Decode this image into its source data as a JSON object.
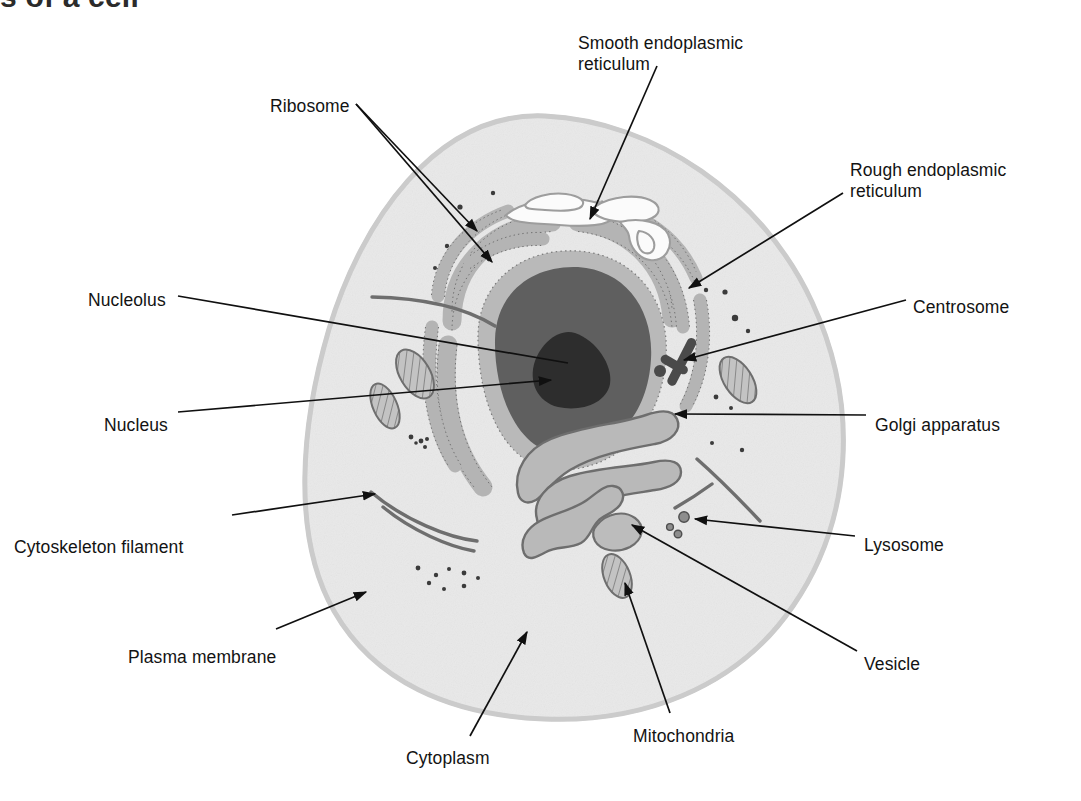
{
  "page": {
    "title_partial": "s of a cell",
    "background_color": "#ffffff",
    "width": 1081,
    "height": 801
  },
  "diagram": {
    "kind": "animal-cell-cross-section",
    "colors": {
      "cytoplasm": "#e8e8e8",
      "cytoplasm_edge": "#d6d6d6",
      "organelle_gray": "#b8b8b8",
      "organelle_outline": "#6e6e6e",
      "nucleoplasm": "#5e5e5e",
      "nucleolus": "#2e2e2e",
      "centrosome": "#4a4a4a",
      "filament": "#6d6d6d",
      "leader_line": "#101010",
      "smooth_er_fill": "#fbfbfb",
      "text": "#131313"
    }
  },
  "labels": [
    {
      "id": "ribosome",
      "text": "Ribosome",
      "x": 270,
      "y": 96,
      "align": "left"
    },
    {
      "id": "smooth-er",
      "text": "Smooth endoplasmic",
      "x": 578,
      "y": 33,
      "align": "left"
    },
    {
      "id": "smooth-er-2",
      "text": "reticulum",
      "x": 578,
      "y": 54,
      "align": "left"
    },
    {
      "id": "rough-er",
      "text": "Rough endoplasmic",
      "x": 850,
      "y": 160,
      "align": "left"
    },
    {
      "id": "rough-er-2",
      "text": "reticulum",
      "x": 850,
      "y": 181,
      "align": "left"
    },
    {
      "id": "nucleolus",
      "text": "Nucleolus",
      "x": 88,
      "y": 290,
      "align": "left"
    },
    {
      "id": "centrosome",
      "text": "Centrosome",
      "x": 913,
      "y": 297,
      "align": "left"
    },
    {
      "id": "nucleus",
      "text": "Nucleus",
      "x": 104,
      "y": 415,
      "align": "left"
    },
    {
      "id": "golgi",
      "text": "Golgi apparatus",
      "x": 875,
      "y": 415,
      "align": "left"
    },
    {
      "id": "cytoskeleton-filament",
      "text": "Cytoskeleton filament",
      "x": 14,
      "y": 537,
      "align": "left"
    },
    {
      "id": "lysosome",
      "text": "Lysosome",
      "x": 864,
      "y": 535,
      "align": "left"
    },
    {
      "id": "plasma-membrane",
      "text": "Plasma membrane",
      "x": 128,
      "y": 647,
      "align": "left"
    },
    {
      "id": "vesicle",
      "text": "Vesicle",
      "x": 864,
      "y": 654,
      "align": "left"
    },
    {
      "id": "mitochondria",
      "text": "Mitochondria",
      "x": 633,
      "y": 726,
      "align": "left"
    },
    {
      "id": "cytoplasm",
      "text": "Cytoplasm",
      "x": 406,
      "y": 748,
      "align": "left"
    }
  ],
  "leaders": [
    {
      "id": "leader-ribosome-a",
      "d": "M 356 104 L 477 231"
    },
    {
      "id": "leader-ribosome-b",
      "d": "M 356 104 L 492 262"
    },
    {
      "id": "leader-smooth-er",
      "d": "M 657 66 L 590 219"
    },
    {
      "id": "leader-rough-er",
      "d": "M 843 193 L 689 288"
    },
    {
      "id": "leader-nucleolus",
      "d": "M 178 296 L 568 363"
    },
    {
      "id": "leader-nucleus",
      "d": "M 178 412 L 551 380"
    },
    {
      "id": "leader-centrosome",
      "d": "M 906 300 L 684 360"
    },
    {
      "id": "leader-golgi",
      "d": "M 866 415 L 675 414"
    },
    {
      "id": "leader-cytoskeleton",
      "d": "M 232 515 L 375 494"
    },
    {
      "id": "leader-lysosome",
      "d": "M 855 536 L 685 517"
    },
    {
      "id": "leader-plasma",
      "d": "M 276 629 L 366 592"
    },
    {
      "id": "leader-vesicle",
      "d": "M 857 651 L 628 521"
    },
    {
      "id": "leader-mitochondria",
      "d": "M 670 713 L 625 577"
    },
    {
      "id": "leader-cytoplasm",
      "d": "M 470 736 L 525 634"
    }
  ],
  "structures": {
    "cell_outline": "M 545 116 C 655 121 760 195 810 300 C 860 405 852 520 795 605 C 738 690 640 722 545 718 C 450 714 375 682 335 612 C 292 537 302 425 330 330 C 362 224 435 111 545 116 Z",
    "nucleus_outer_label": "nuclear envelope with ribosomes",
    "nucleolus_label": "dense nucleolus",
    "mitochondria_count": 4,
    "ribosome_dot_count": 28,
    "filament_count": 5
  }
}
